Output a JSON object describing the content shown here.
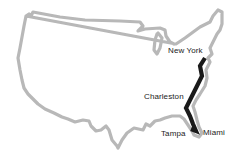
{
  "map": {
    "region": "United States",
    "outline_color": "#b8b8b8",
    "route_color": "#1a1a1a",
    "route": [
      "New York",
      "Charleston",
      "Miami",
      "Tampa"
    ],
    "labels": {
      "new_york": "New York",
      "charleston": "Charleston",
      "tampa": "Tampa",
      "miami": "Miami"
    }
  }
}
